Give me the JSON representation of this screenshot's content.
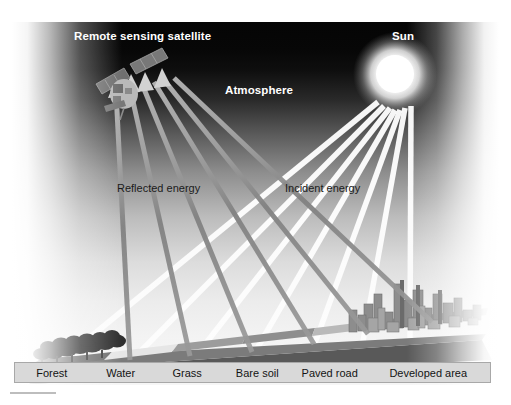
{
  "figure": {
    "title_alt": "Remote sensing energy interaction diagram",
    "scene_labels": {
      "satellite": "Remote sensing satellite",
      "sun": "Sun",
      "atmosphere": "Atmosphere",
      "reflected": "Reflected energy",
      "incident": "Incident energy"
    },
    "surface_types": [
      {
        "name": "Forest",
        "width_pct": 15.5
      },
      {
        "name": "Water",
        "width_pct": 13.5
      },
      {
        "name": "Grass",
        "width_pct": 14.5
      },
      {
        "name": "Bare soil",
        "width_pct": 15.0
      },
      {
        "name": "Paved road",
        "width_pct": 15.5
      },
      {
        "name": "Developed area",
        "width_pct": 26.0
      }
    ],
    "colors": {
      "sky_top": "#050505",
      "sky_bottom": "#f6f6f6",
      "sun_core": "#ffffff",
      "sun_glow": "#f2f2f2",
      "incident_ray": "#f7f7f7",
      "reflected_ray": "#8a8a8a",
      "label_bar_fill": "#d9d9d9",
      "label_bar_border": "#a8a8a8",
      "label_text": "#141414",
      "white_text": "#ffffff",
      "dark_text": "#1b1b1b",
      "ground_base": "#6f6f6f",
      "city_block": "#8b8b8b",
      "forest_canopy": "#2b2b2b",
      "water_surface": "#ededed"
    },
    "ray_counts": {
      "incident_rays": 7,
      "reflected_rays": 6
    }
  }
}
